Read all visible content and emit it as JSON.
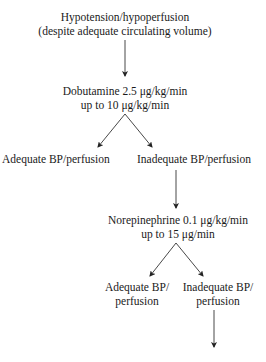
{
  "flowchart": {
    "nodes": {
      "start": {
        "line1": "Hypotension/hypoperfusion",
        "line2": "(despite adequate circulating volume)"
      },
      "dobutamine": {
        "line1": "Dobutamine 2.5 μg/kg/min",
        "line2": "up to 10 μg/kg/min"
      },
      "dobutamine_adequate": {
        "line1": "Adequate BP/perfusion"
      },
      "dobutamine_inadequate": {
        "line1": "Inadequate BP/perfusion"
      },
      "norepinephrine": {
        "line1": "Norepinephrine 0.1 μg/kg/min",
        "line2": "up to 15 μg/min"
      },
      "norepinephrine_adequate": {
        "line1": "Adequate BP/",
        "line2": "perfusion"
      },
      "norepinephrine_inadequate": {
        "line1": "Inadequate BP/",
        "line2": "perfusion"
      },
      "next_step_cutoff": {
        "line1": ""
      }
    },
    "edges": [
      {
        "from": "start",
        "to": "dobutamine"
      },
      {
        "from": "dobutamine",
        "to": "dobutamine_adequate"
      },
      {
        "from": "dobutamine",
        "to": "dobutamine_inadequate"
      },
      {
        "from": "dobutamine_inadequate",
        "to": "norepinephrine"
      },
      {
        "from": "norepinephrine",
        "to": "norepinephrine_adequate"
      },
      {
        "from": "norepinephrine",
        "to": "norepinephrine_inadequate"
      },
      {
        "from": "norepinephrine_inadequate",
        "to": "next_step_cutoff"
      }
    ]
  }
}
